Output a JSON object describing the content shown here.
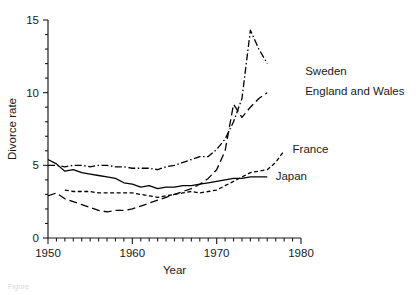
{
  "chart_data": {
    "type": "line",
    "title": "",
    "xlabel": "Year",
    "ylabel": "Divorce rate",
    "xlim": [
      1950,
      1980
    ],
    "ylim": [
      0,
      15
    ],
    "xticks": [
      1950,
      1960,
      1970,
      1980
    ],
    "xtick_labels": [
      "1950",
      "1960",
      "1970",
      "1980"
    ],
    "xtick_minor_step": 1,
    "yticks": [
      0,
      5,
      10,
      15
    ],
    "ytick_labels": [
      "0",
      "5",
      "10",
      "15"
    ],
    "ytick_minor_step": 1,
    "grid": false,
    "legend_position": "inline-right-of-series",
    "series": [
      {
        "name": "Sweden",
        "label": "Sweden",
        "line_style": "dash-dot",
        "color": "#000000",
        "label_x": 1980.5,
        "label_y": 11.5,
        "x": [
          1950,
          1951,
          1952,
          1953,
          1954,
          1955,
          1956,
          1957,
          1958,
          1959,
          1960,
          1961,
          1962,
          1963,
          1964,
          1965,
          1966,
          1967,
          1968,
          1969,
          1970,
          1971,
          1972,
          1973,
          1974,
          1975,
          1976
        ],
        "values": [
          5.0,
          5.0,
          4.9,
          5.0,
          5.0,
          4.9,
          5.0,
          5.0,
          4.9,
          4.9,
          4.8,
          4.8,
          4.8,
          4.7,
          4.9,
          5.0,
          5.2,
          5.4,
          5.6,
          5.6,
          6.1,
          6.8,
          8.0,
          9.6,
          14.3,
          13.0,
          12.0
        ],
        "peak": {
          "year": 1974,
          "value": 14.3
        }
      },
      {
        "name": "England and Wales",
        "label": "England and Wales",
        "line_style": "long-dash",
        "color": "#000000",
        "label_x": 1980.5,
        "label_y": 10.1,
        "x": [
          1950,
          1951,
          1952,
          1953,
          1954,
          1955,
          1956,
          1957,
          1958,
          1959,
          1960,
          1961,
          1962,
          1963,
          1964,
          1965,
          1966,
          1967,
          1968,
          1969,
          1970,
          1971,
          1972,
          1973,
          1974,
          1975,
          1976
        ],
        "values": [
          2.9,
          3.1,
          2.7,
          2.5,
          2.3,
          2.1,
          1.9,
          1.8,
          1.9,
          1.9,
          2.0,
          2.2,
          2.4,
          2.6,
          2.8,
          3.0,
          3.2,
          3.4,
          3.7,
          4.1,
          4.7,
          6.0,
          9.2,
          8.3,
          9.0,
          9.6,
          10.0
        ]
      },
      {
        "name": "France",
        "label": "France",
        "line_style": "short-dash",
        "color": "#000000",
        "label_x": 1979.0,
        "label_y": 6.1,
        "x": [
          1952,
          1953,
          1954,
          1955,
          1956,
          1957,
          1958,
          1959,
          1960,
          1961,
          1962,
          1963,
          1964,
          1965,
          1966,
          1967,
          1968,
          1969,
          1970,
          1971,
          1972,
          1973,
          1974,
          1975,
          1976,
          1977,
          1978
        ],
        "values": [
          3.3,
          3.2,
          3.2,
          3.2,
          3.1,
          3.1,
          3.1,
          3.1,
          3.1,
          3.0,
          2.9,
          2.8,
          2.9,
          3.0,
          3.1,
          3.2,
          3.1,
          3.2,
          3.3,
          3.6,
          3.9,
          4.2,
          4.5,
          4.6,
          4.7,
          5.2,
          6.0
        ]
      },
      {
        "name": "Japan",
        "label": "Japan",
        "line_style": "solid",
        "color": "#000000",
        "label_x": 1977.0,
        "label_y": 4.3,
        "x": [
          1950,
          1951,
          1952,
          1953,
          1954,
          1955,
          1956,
          1957,
          1958,
          1959,
          1960,
          1961,
          1962,
          1963,
          1964,
          1965,
          1966,
          1967,
          1968,
          1969,
          1970,
          1971,
          1972,
          1973,
          1974,
          1975,
          1976
        ],
        "values": [
          5.4,
          5.1,
          4.6,
          4.7,
          4.5,
          4.4,
          4.3,
          4.2,
          4.1,
          3.8,
          3.7,
          3.5,
          3.6,
          3.4,
          3.5,
          3.5,
          3.6,
          3.6,
          3.7,
          3.8,
          3.9,
          4.0,
          4.1,
          4.1,
          4.2,
          4.2,
          4.2
        ]
      }
    ]
  },
  "caption": {
    "text": "Figure"
  }
}
